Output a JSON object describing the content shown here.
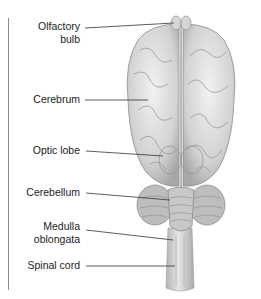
{
  "diagram": {
    "labels": [
      {
        "id": "olfactory-bulb",
        "lines": [
          "Olfactory",
          "bulb"
        ]
      },
      {
        "id": "cerebrum",
        "lines": [
          "Cerebrum"
        ]
      },
      {
        "id": "optic-lobe",
        "lines": [
          "Optic lobe"
        ]
      },
      {
        "id": "cerebellum",
        "lines": [
          "Cerebellum"
        ]
      },
      {
        "id": "medulla-oblongata",
        "lines": [
          "Medulla",
          "oblongata"
        ]
      },
      {
        "id": "spinal-cord",
        "lines": [
          "Spinal cord"
        ]
      }
    ],
    "colors": {
      "line": "#333333",
      "brain_light": "#e8e8e8",
      "brain_mid": "#bdbdbd",
      "brain_dark": "#8c8c8c",
      "border": "#8a8a8a"
    }
  }
}
